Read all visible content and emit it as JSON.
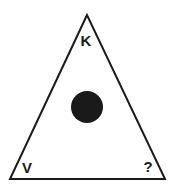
{
  "diagram": {
    "shape": "triangle",
    "stroke_color": "#1a1a1a",
    "fill_color": "#ffffff",
    "center_circle_color": "#1a1a1a",
    "labels": {
      "top": "K",
      "bottom_left": "V",
      "bottom_right": "?"
    }
  }
}
